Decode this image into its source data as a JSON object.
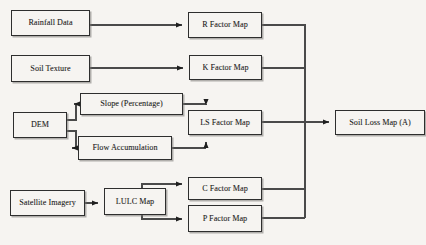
{
  "diagram": {
    "type": "flowchart",
    "background_color": "#f6f4f1",
    "border_color": "#2e2e2e",
    "text_color": "#1b1b1b",
    "nodes": [
      {
        "id": "rainfall_data",
        "label": "Rainfall Data",
        "x": 11,
        "y": 10,
        "w": 79,
        "h": 26
      },
      {
        "id": "soil_texture",
        "label": "Soil Texture",
        "x": 11,
        "y": 55,
        "w": 79,
        "h": 27
      },
      {
        "id": "dem",
        "label": "DEM",
        "x": 13,
        "y": 112,
        "w": 54,
        "h": 26
      },
      {
        "id": "satellite_imagery",
        "label": "Satellite Imagery",
        "x": 10,
        "y": 190,
        "w": 75,
        "h": 26
      },
      {
        "id": "slope_percentage",
        "label": "Slope (Percentage)",
        "x": 80,
        "y": 93,
        "w": 103,
        "h": 22
      },
      {
        "id": "flow_accumulation",
        "label": "Flow Accumulation",
        "x": 78,
        "y": 136,
        "w": 94,
        "h": 24
      },
      {
        "id": "lulc_map",
        "label": "LULC Map",
        "x": 104,
        "y": 188,
        "w": 62,
        "h": 27
      },
      {
        "id": "r_factor_map",
        "label": "R Factor Map",
        "x": 188,
        "y": 12,
        "w": 74,
        "h": 26
      },
      {
        "id": "k_factor_map",
        "label": "K Factor Map",
        "x": 189,
        "y": 55,
        "w": 73,
        "h": 25
      },
      {
        "id": "ls_factor_map",
        "label": "LS Factor Map",
        "x": 188,
        "y": 110,
        "w": 74,
        "h": 25
      },
      {
        "id": "c_factor_map",
        "label": "C Factor Map",
        "x": 188,
        "y": 177,
        "w": 74,
        "h": 23
      },
      {
        "id": "p_factor_map",
        "label": "P Factor Map",
        "x": 188,
        "y": 205,
        "w": 74,
        "h": 27
      },
      {
        "id": "soil_loss_map",
        "label": "Soil Loss Map (A)",
        "x": 335,
        "y": 110,
        "w": 90,
        "h": 25
      }
    ],
    "edges": [
      {
        "from": "rainfall_data",
        "to": "r_factor_map",
        "path": "M 90 25 L 185 25",
        "arrow": "right"
      },
      {
        "from": "soil_texture",
        "to": "k_factor_map",
        "path": "M 90 68 L 186 68",
        "arrow": "right"
      },
      {
        "from": "dem",
        "to": "slope_percentage",
        "path": "M 67 120 L 76 120 L 76 104 L 77 104",
        "arrow": "right"
      },
      {
        "from": "dem",
        "to": "flow_accumulation",
        "path": "M 67 131 L 76 131 L 76 148 L 75 148",
        "arrow": "right"
      },
      {
        "from": "slope_percentage",
        "to": "ls_factor_map",
        "path": "M 183 104 L 206 104 L 206 106",
        "arrow": "down"
      },
      {
        "from": "flow_accumulation",
        "to": "ls_factor_map",
        "path": "M 172 148 L 206 148 L 206 141",
        "arrow": "up"
      },
      {
        "from": "satellite_imagery",
        "to": "lulc_map",
        "path": "M 85 203 L 101 203",
        "arrow": "right"
      },
      {
        "from": "lulc_map",
        "to": "c_factor_map",
        "path": "M 142 188 L 142 188 L 142 188",
        "arrow": "right"
      },
      {
        "from": "lulc_map",
        "to": "p_factor_map",
        "path": "M 142 215 L 142 219 L 185 219",
        "arrow": "right"
      },
      {
        "from": "r_factor_map",
        "to": "bus",
        "path": "M 262 25 L 305 25 L 305 218",
        "arrow": "none"
      },
      {
        "from": "k_factor_map",
        "to": "bus",
        "path": "M 262 68 L 305 68",
        "arrow": "none"
      },
      {
        "from": "c_factor_map",
        "to": "bus",
        "path": "M 262 189 L 305 189",
        "arrow": "none"
      },
      {
        "from": "p_factor_map",
        "to": "bus",
        "path": "M 262 218 L 305 218",
        "arrow": "none"
      },
      {
        "from": "ls_factor_map",
        "to": "soil_loss_map",
        "path": "M 262 122 L 332 122",
        "arrow": "right"
      }
    ]
  }
}
